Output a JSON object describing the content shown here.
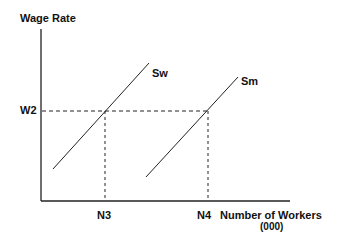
{
  "diagram": {
    "type": "supply-curves",
    "y_axis_label": "Wage Rate",
    "x_axis_label": "Number of Workers",
    "x_axis_unit": "(000)",
    "curves": [
      {
        "name": "Sw",
        "label": "Sw"
      },
      {
        "name": "Sm",
        "label": "Sm"
      }
    ],
    "y_markers": [
      {
        "label": "W2"
      }
    ],
    "x_markers": [
      {
        "label": "N3"
      },
      {
        "label": "N4"
      }
    ],
    "colors": {
      "line": "#222222",
      "background": "#ffffff"
    }
  }
}
